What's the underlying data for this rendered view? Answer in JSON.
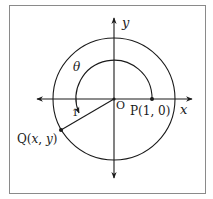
{
  "diagram": {
    "type": "unit-circle",
    "labels": {
      "y_axis": "y",
      "x_axis": "x",
      "theta": "θ",
      "origin": "O",
      "point_p": "P(1, 0)",
      "point_q_prefix": "Q(",
      "point_q_x": "x",
      "point_q_sep": ", ",
      "point_q_y": "y",
      "point_q_suffix": ")",
      "radius": "1"
    },
    "colors": {
      "stroke": "#1a1a1a",
      "frame": "#8a8a8a",
      "background": "#ffffff"
    }
  }
}
